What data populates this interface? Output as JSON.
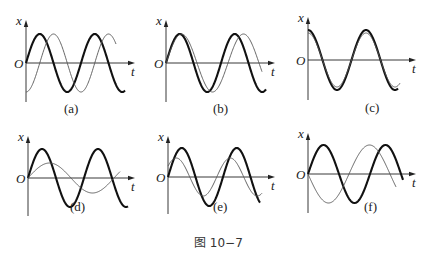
{
  "figure_caption": "图 10−7",
  "axis_labels": {
    "y": "x",
    "x": "t",
    "origin": "O"
  },
  "panels": [
    {
      "id": "a",
      "caption": "(a)",
      "origin": [
        26,
        63
      ],
      "x_end": 135,
      "y_top": 20,
      "y_bottom": 102,
      "cap_pos": [
        64,
        113
      ],
      "curves": [
        {
          "style": "thick",
          "amp": 29,
          "period": 55,
          "phase_deg": 0,
          "offset": 0,
          "t_end": 99
        },
        {
          "style": "thin",
          "amp": 29,
          "period": 55,
          "phase_deg": -90,
          "offset": 0,
          "t_end": 90
        }
      ]
    },
    {
      "id": "b",
      "caption": "(b)",
      "origin": [
        166,
        63
      ],
      "x_end": 275,
      "y_top": 20,
      "y_bottom": 102,
      "cap_pos": [
        213,
        113
      ],
      "curves": [
        {
          "style": "thick",
          "amp": 29,
          "period": 55,
          "phase_deg": 0,
          "offset": 0,
          "t_end": 100
        },
        {
          "style": "thin",
          "amp": 29,
          "period": 62,
          "phase_deg": 0,
          "offset": 0,
          "t_end": 96
        }
      ]
    },
    {
      "id": "c",
      "caption": "(c)",
      "origin": [
        308,
        60
      ],
      "x_end": 416,
      "y_top": 17,
      "y_bottom": 100,
      "cap_pos": [
        365,
        112
      ],
      "curves": [
        {
          "style": "thick",
          "amp": 30,
          "period": 58,
          "phase_deg": 90,
          "offset": 0,
          "t_end": 90
        },
        {
          "style": "thin",
          "amp": 27,
          "period": 58,
          "phase_deg": 90,
          "offset": 0,
          "t_end": 92
        }
      ]
    },
    {
      "id": "d",
      "caption": "(d)",
      "origin": [
        28,
        178
      ],
      "x_end": 135,
      "y_top": 136,
      "y_bottom": 216,
      "cap_pos": [
        70,
        211
      ],
      "curves": [
        {
          "style": "thick",
          "amp": 29,
          "period": 56,
          "phase_deg": 0,
          "offset": 0,
          "t_end": 100
        },
        {
          "style": "thin",
          "amp": 15,
          "period": 86,
          "phase_deg": 0,
          "offset": 0,
          "t_end": 92
        }
      ]
    },
    {
      "id": "e",
      "caption": "(e)",
      "origin": [
        168,
        177
      ],
      "x_end": 275,
      "y_top": 136,
      "y_bottom": 214,
      "cap_pos": [
        213,
        211
      ],
      "curves": [
        {
          "style": "thick",
          "amp": 29,
          "period": 55,
          "phase_deg": 0,
          "offset": 0,
          "t_end": 92
        },
        {
          "style": "thin",
          "amp": 19,
          "period": 54,
          "phase_deg": 35,
          "offset": 0,
          "t_end": 94
        }
      ]
    },
    {
      "id": "f",
      "caption": "(f)",
      "origin": [
        308,
        174
      ],
      "x_end": 416,
      "y_top": 133,
      "y_bottom": 213,
      "cap_pos": [
        364,
        211
      ],
      "curves": [
        {
          "style": "thick",
          "amp": 29,
          "period": 62,
          "phase_deg": 0,
          "offset": 0,
          "t_end": 95
        },
        {
          "style": "thin",
          "amp": 29,
          "period": 82,
          "phase_deg": 180,
          "offset": 0,
          "t_end": 88
        }
      ]
    }
  ]
}
